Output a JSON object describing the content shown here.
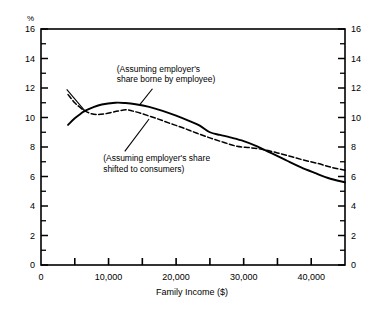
{
  "chart_data": {
    "type": "line",
    "title": "",
    "subtitle": "",
    "xlabel": "Family Income ($)",
    "ylabel": "%",
    "unit_label": "%",
    "xlim": [
      0,
      45000
    ],
    "ylim": [
      0,
      16
    ],
    "grid": false,
    "legend": "annotations-inline",
    "x_ticks_major": [
      0,
      10000,
      20000,
      30000,
      40000
    ],
    "x_tick_labels": [
      "0",
      "10,000",
      "20,000",
      "30,000",
      "40,000"
    ],
    "x_ticks_minor": [
      5000,
      15000,
      25000,
      35000
    ],
    "y_ticks_major": [
      0,
      2,
      4,
      6,
      8,
      10,
      12,
      14,
      16
    ],
    "y_tick_labels": [
      "0",
      "2",
      "4",
      "6",
      "8",
      "10",
      "12",
      "14",
      "16"
    ],
    "y_ticks_minor": [
      1,
      3,
      5,
      7,
      9,
      11,
      13,
      15
    ],
    "right_axis_labels": [
      "0",
      "2",
      "4",
      "6",
      "8",
      "10",
      "12",
      "14",
      "16"
    ],
    "series": [
      {
        "name": "Assuming employer's share borne by employee",
        "style": "solid",
        "color": "#000000",
        "points": [
          [
            4000,
            9.5
          ],
          [
            5000,
            9.95
          ],
          [
            6000,
            10.3
          ],
          [
            6500,
            10.45
          ],
          [
            7500,
            10.65
          ],
          [
            9000,
            10.88
          ],
          [
            11000,
            11.0
          ],
          [
            12500,
            10.98
          ],
          [
            14000,
            10.9
          ],
          [
            16000,
            10.72
          ],
          [
            18000,
            10.45
          ],
          [
            20000,
            10.12
          ],
          [
            22000,
            9.75
          ],
          [
            23500,
            9.45
          ],
          [
            25000,
            9.0
          ],
          [
            26500,
            8.82
          ],
          [
            28000,
            8.65
          ],
          [
            30000,
            8.4
          ],
          [
            32000,
            8.05
          ],
          [
            33000,
            7.82
          ],
          [
            34500,
            7.5
          ],
          [
            36500,
            7.05
          ],
          [
            38500,
            6.62
          ],
          [
            40500,
            6.25
          ],
          [
            42500,
            5.9
          ],
          [
            45000,
            5.6
          ]
        ]
      },
      {
        "name": "Assuming employer's share shifted to consumers",
        "style": "dashed",
        "color": "#000000",
        "points": [
          [
            4000,
            11.55
          ],
          [
            5000,
            11.0
          ],
          [
            6000,
            10.6
          ],
          [
            6500,
            10.45
          ],
          [
            7500,
            10.25
          ],
          [
            8500,
            10.2
          ],
          [
            9500,
            10.25
          ],
          [
            11000,
            10.4
          ],
          [
            12500,
            10.52
          ],
          [
            13500,
            10.45
          ],
          [
            15000,
            10.25
          ],
          [
            17000,
            9.95
          ],
          [
            19000,
            9.62
          ],
          [
            21000,
            9.3
          ],
          [
            23000,
            8.95
          ],
          [
            25000,
            8.62
          ],
          [
            27000,
            8.32
          ],
          [
            29000,
            8.05
          ],
          [
            31000,
            7.95
          ],
          [
            33000,
            7.82
          ],
          [
            35000,
            7.6
          ],
          [
            37000,
            7.35
          ],
          [
            39000,
            7.1
          ],
          [
            41000,
            6.88
          ],
          [
            43000,
            6.62
          ],
          [
            45000,
            6.42
          ]
        ]
      }
    ],
    "annotations": [
      {
        "id": "annotation-upper",
        "lines": [
          "(Assuming employer's",
          "share borne by employee)"
        ],
        "text_x": 11200,
        "text_y": 13.1,
        "leader_from": [
          16500,
          11.95
        ],
        "leader_to": [
          14600,
          10.85
        ]
      },
      {
        "id": "annotation-lower",
        "lines": [
          "(Assuming employer's share",
          "shifted to consumers)"
        ],
        "text_x": 9200,
        "text_y": 7.05,
        "leader_from": [
          12400,
          7.7
        ],
        "leader_to": [
          16000,
          9.9
        ]
      },
      {
        "id": "leader-left-crossing",
        "lines": [],
        "leader_from": [
          3800,
          11.9
        ],
        "leader_to": [
          6500,
          10.45
        ]
      }
    ]
  }
}
